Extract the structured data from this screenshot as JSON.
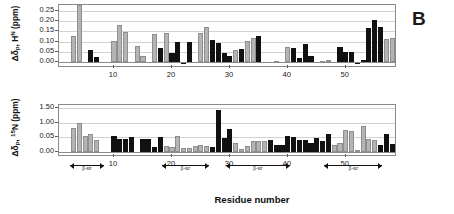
{
  "figure": {
    "panel_letter": "B",
    "xaxis_title": "Residue number"
  },
  "chart_data": [
    {
      "id": "hn-panel",
      "type": "bar",
      "title": "",
      "xlabel": "Residue number",
      "ylabel": "Δδp, HN (ppm)",
      "ylabel_parts": {
        "delta": "Δδ",
        "sub": "p",
        "comma": ", H",
        "sup": "N",
        "units": " (ppm)"
      },
      "ylim": [
        -0.02,
        0.28
      ],
      "yticks": [
        "0.25",
        "0.20",
        "0.15",
        "0.10",
        "0.05",
        "0.00"
      ],
      "ytick_values": [
        0.25,
        0.2,
        0.15,
        0.1,
        0.05,
        0.0
      ],
      "xlim": [
        1,
        58
      ],
      "xticks": [
        "10",
        "20",
        "30",
        "40",
        "50"
      ],
      "xtick_values": [
        10,
        20,
        30,
        40,
        50
      ],
      "grid": true,
      "legend": "none",
      "series": [
        {
          "name": "Δδp HN",
          "colors": {
            "gray": "#b4b4b4",
            "black": "#111111"
          },
          "points": [
            {
              "x": 3,
              "v": 0.13,
              "c": "gray"
            },
            {
              "x": 4,
              "v": 0.28,
              "c": "gray"
            },
            {
              "x": 6,
              "v": 0.06,
              "c": "black"
            },
            {
              "x": 7,
              "v": 0.025,
              "c": "black"
            },
            {
              "x": 10,
              "v": 0.105,
              "c": "gray"
            },
            {
              "x": 11,
              "v": 0.18,
              "c": "gray"
            },
            {
              "x": 12,
              "v": 0.148,
              "c": "gray"
            },
            {
              "x": 14,
              "v": 0.08,
              "c": "gray"
            },
            {
              "x": 15,
              "v": 0.03,
              "c": "gray"
            },
            {
              "x": 17,
              "v": 0.137,
              "c": "gray"
            },
            {
              "x": 18,
              "v": 0.068,
              "c": "black"
            },
            {
              "x": 19,
              "v": 0.14,
              "c": "gray"
            },
            {
              "x": 20,
              "v": 0.043,
              "c": "black"
            },
            {
              "x": 21,
              "v": 0.1,
              "c": "black"
            },
            {
              "x": 22,
              "v": -0.01,
              "c": "black"
            },
            {
              "x": 23,
              "v": 0.096,
              "c": "black"
            },
            {
              "x": 25,
              "v": 0.14,
              "c": "gray"
            },
            {
              "x": 26,
              "v": 0.17,
              "c": "gray"
            },
            {
              "x": 27,
              "v": 0.108,
              "c": "black"
            },
            {
              "x": 28,
              "v": 0.092,
              "c": "black"
            },
            {
              "x": 29,
              "v": 0.042,
              "c": "black"
            },
            {
              "x": 30,
              "v": 0.03,
              "c": "black"
            },
            {
              "x": 31,
              "v": 0.06,
              "c": "gray"
            },
            {
              "x": 32,
              "v": 0.065,
              "c": "black"
            },
            {
              "x": 33,
              "v": 0.105,
              "c": "gray"
            },
            {
              "x": 34,
              "v": 0.12,
              "c": "gray"
            },
            {
              "x": 35,
              "v": 0.128,
              "c": "black"
            },
            {
              "x": 36,
              "v": 0.002,
              "c": "black"
            },
            {
              "x": 38,
              "v": 0.004,
              "c": "gray"
            },
            {
              "x": 40,
              "v": 0.072,
              "c": "gray"
            },
            {
              "x": 41,
              "v": 0.068,
              "c": "black"
            },
            {
              "x": 42,
              "v": 0.02,
              "c": "black"
            },
            {
              "x": 43,
              "v": 0.09,
              "c": "black"
            },
            {
              "x": 44,
              "v": 0.03,
              "c": "black"
            },
            {
              "x": 46,
              "v": 0.006,
              "c": "gray"
            },
            {
              "x": 47,
              "v": 0.01,
              "c": "gray"
            },
            {
              "x": 49,
              "v": 0.072,
              "c": "black"
            },
            {
              "x": 50,
              "v": 0.05,
              "c": "black"
            },
            {
              "x": 51,
              "v": 0.048,
              "c": "black"
            },
            {
              "x": 52,
              "v": -0.008,
              "c": "black"
            },
            {
              "x": 53,
              "v": 0.01,
              "c": "black"
            },
            {
              "x": 54,
              "v": 0.165,
              "c": "black"
            },
            {
              "x": 55,
              "v": 0.205,
              "c": "black"
            },
            {
              "x": 56,
              "v": 0.17,
              "c": "black"
            },
            {
              "x": 57,
              "v": 0.115,
              "c": "gray"
            },
            {
              "x": 58,
              "v": 0.118,
              "c": "gray"
            }
          ]
        }
      ]
    },
    {
      "id": "n15-panel",
      "type": "bar",
      "title": "",
      "xlabel": "Residue number",
      "ylabel": "Δδp, 15N (ppm)",
      "ylabel_parts": {
        "delta": "Δδ",
        "sub": "p",
        "comma": ", ",
        "sup": "15",
        "n": "N",
        "units": " (ppm)"
      },
      "ylim": [
        -0.1,
        1.6
      ],
      "yticks": [
        "1.50",
        "1.00",
        "0.05",
        "0.00"
      ],
      "ytick_values": [
        1.5,
        1.0,
        0.5,
        0.0
      ],
      "xlim": [
        1,
        58
      ],
      "xticks": [
        "10",
        "20",
        "30",
        "40",
        "50"
      ],
      "xtick_values": [
        10,
        20,
        30,
        40,
        50
      ],
      "grid": true,
      "legend": "none",
      "series": [
        {
          "name": "Δδp 15N",
          "colors": {
            "gray": "#b4b4b4",
            "black": "#111111"
          },
          "points": [
            {
              "x": 3,
              "v": 0.81,
              "c": "gray"
            },
            {
              "x": 4,
              "v": 1.0,
              "c": "gray"
            },
            {
              "x": 5,
              "v": 0.56,
              "c": "gray"
            },
            {
              "x": 6,
              "v": 0.62,
              "c": "gray"
            },
            {
              "x": 7,
              "v": 0.41,
              "c": "gray"
            },
            {
              "x": 10,
              "v": 0.55,
              "c": "black"
            },
            {
              "x": 11,
              "v": 0.44,
              "c": "black"
            },
            {
              "x": 12,
              "v": 0.43,
              "c": "black"
            },
            {
              "x": 13,
              "v": 0.5,
              "c": "black"
            },
            {
              "x": 15,
              "v": 0.45,
              "c": "black"
            },
            {
              "x": 16,
              "v": 0.44,
              "c": "black"
            },
            {
              "x": 17,
              "v": 0.17,
              "c": "black"
            },
            {
              "x": 18,
              "v": 0.52,
              "c": "black"
            },
            {
              "x": 19,
              "v": 0.2,
              "c": "gray"
            },
            {
              "x": 20,
              "v": 0.18,
              "c": "gray"
            },
            {
              "x": 21,
              "v": 0.55,
              "c": "gray"
            },
            {
              "x": 22,
              "v": 0.15,
              "c": "gray"
            },
            {
              "x": 23,
              "v": 0.14,
              "c": "gray"
            },
            {
              "x": 24,
              "v": 0.21,
              "c": "gray"
            },
            {
              "x": 25,
              "v": 0.23,
              "c": "gray"
            },
            {
              "x": 26,
              "v": 0.22,
              "c": "gray"
            },
            {
              "x": 27,
              "v": 0.17,
              "c": "black"
            },
            {
              "x": 28,
              "v": 1.43,
              "c": "black"
            },
            {
              "x": 29,
              "v": 0.48,
              "c": "black"
            },
            {
              "x": 30,
              "v": 0.8,
              "c": "black"
            },
            {
              "x": 31,
              "v": 0.32,
              "c": "gray"
            },
            {
              "x": 32,
              "v": 0.1,
              "c": "gray"
            },
            {
              "x": 33,
              "v": 0.22,
              "c": "gray"
            },
            {
              "x": 34,
              "v": 0.38,
              "c": "gray"
            },
            {
              "x": 35,
              "v": 0.36,
              "c": "gray"
            },
            {
              "x": 36,
              "v": 0.38,
              "c": "gray"
            },
            {
              "x": 37,
              "v": 0.4,
              "c": "black"
            },
            {
              "x": 38,
              "v": 0.23,
              "c": "black"
            },
            {
              "x": 39,
              "v": 0.25,
              "c": "black"
            },
            {
              "x": 40,
              "v": 0.55,
              "c": "black"
            },
            {
              "x": 41,
              "v": 0.5,
              "c": "black"
            },
            {
              "x": 42,
              "v": 0.4,
              "c": "black"
            },
            {
              "x": 43,
              "v": 0.4,
              "c": "black"
            },
            {
              "x": 44,
              "v": 0.3,
              "c": "black"
            },
            {
              "x": 45,
              "v": 0.48,
              "c": "black"
            },
            {
              "x": 46,
              "v": 0.38,
              "c": "black"
            },
            {
              "x": 47,
              "v": 0.62,
              "c": "black"
            },
            {
              "x": 48,
              "v": 0.25,
              "c": "gray"
            },
            {
              "x": 49,
              "v": 0.3,
              "c": "gray"
            },
            {
              "x": 50,
              "v": 0.76,
              "c": "gray"
            },
            {
              "x": 51,
              "v": 0.72,
              "c": "gray"
            },
            {
              "x": 52,
              "v": 0.08,
              "c": "gray"
            },
            {
              "x": 53,
              "v": 0.9,
              "c": "gray"
            },
            {
              "x": 54,
              "v": 0.44,
              "c": "gray"
            },
            {
              "x": 55,
              "v": 0.4,
              "c": "gray"
            },
            {
              "x": 56,
              "v": 0.24,
              "c": "black"
            },
            {
              "x": 57,
              "v": 0.6,
              "c": "black"
            },
            {
              "x": 58,
              "v": 0.28,
              "c": "black"
            }
          ]
        }
      ],
      "secondary_structure": [
        {
          "label": "β-str",
          "start": 3,
          "end": 8
        },
        {
          "label": "β-str",
          "start": 19,
          "end": 26
        },
        {
          "label": "β-str",
          "start": 30,
          "end": 40
        },
        {
          "label": "β-str",
          "start": 47,
          "end": 56
        }
      ]
    }
  ]
}
